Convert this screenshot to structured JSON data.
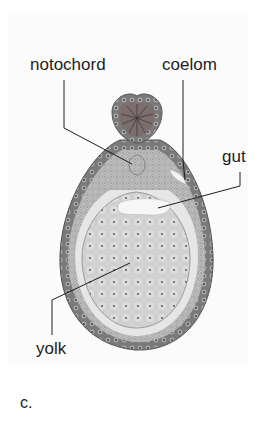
{
  "figure": {
    "labels": {
      "notochord": "notochord",
      "coelom": "coelom",
      "gut": "gut",
      "yolk": "yolk"
    },
    "caption": "c."
  },
  "colors": {
    "ectoderm": "#8a8a8a",
    "mesoderm": "#b5b5b5",
    "yolk": "#d8d8d8",
    "lines": "#1e1e1e"
  }
}
